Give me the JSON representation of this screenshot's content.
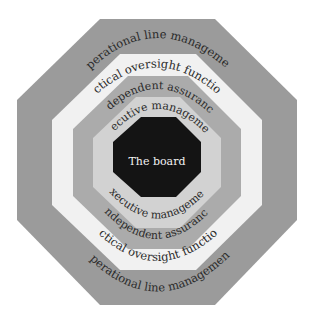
{
  "diagram": {
    "type": "concentric-octagons",
    "layers": [
      {
        "id": "operational",
        "top_label": "Operational line management",
        "bottom_label": "Operational line management",
        "color": "#9b9b9b"
      },
      {
        "id": "tactical",
        "top_label": "Tactical oversight functions",
        "bottom_label": "Tactical oversight functions",
        "color": "#f1f1f1"
      },
      {
        "id": "independent",
        "top_label": "Independent assurance",
        "bottom_label": "Independent assurance",
        "color": "#ababab"
      },
      {
        "id": "executive",
        "top_label": "Executive management",
        "bottom_label": "Executive management",
        "color": "#d2d2d2"
      },
      {
        "id": "board",
        "label": "The board",
        "color": "#141414"
      }
    ]
  }
}
